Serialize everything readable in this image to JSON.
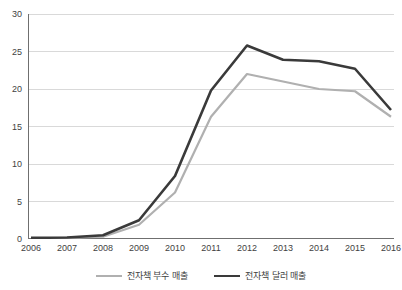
{
  "chart_data": {
    "type": "line",
    "title": "",
    "xlabel": "",
    "ylabel": "",
    "categories": [
      "2006",
      "2007",
      "2008",
      "2009",
      "2010",
      "2011",
      "2012",
      "2013",
      "2014",
      "2015",
      "2016"
    ],
    "x": [
      2006,
      2007,
      2008,
      2009,
      2010,
      2011,
      2012,
      2013,
      2014,
      2015,
      2016
    ],
    "ylim": [
      0,
      30
    ],
    "yticks": [
      0,
      5,
      10,
      15,
      20,
      25,
      30
    ],
    "ytick_labels": [
      "0",
      "5",
      "10",
      "15",
      "20",
      "25",
      "30"
    ],
    "grid": "horizontal",
    "legend_position": "bottom-center",
    "series": [
      {
        "name": "전자책 부수 매출",
        "color": "#b0b0b0",
        "line_width": 2.2,
        "values": [
          0.1,
          0.15,
          0.3,
          1.9,
          6.2,
          16.3,
          22.0,
          21.0,
          20.0,
          19.7,
          16.3
        ]
      },
      {
        "name": "전자책 달러 매출",
        "color": "#3a3a3a",
        "line_width": 2.6,
        "values": [
          0.15,
          0.2,
          0.5,
          2.5,
          8.4,
          19.8,
          25.8,
          23.9,
          23.7,
          22.7,
          17.2
        ]
      }
    ]
  },
  "axis": {
    "y_axis_line_color": "#6f6f6f",
    "x_axis_line_color": "#6f6f6f",
    "gridline_color": "#d9d9d9"
  },
  "legend": {
    "items": [
      {
        "label": "전자책 부수 매출",
        "color": "#b0b0b0",
        "thickness": 2.2
      },
      {
        "label": "전자책 달러 매출",
        "color": "#3a3a3a",
        "thickness": 2.6
      }
    ]
  }
}
